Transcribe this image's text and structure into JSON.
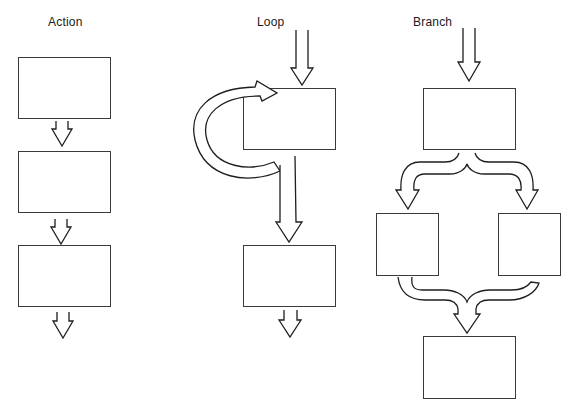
{
  "diagram": {
    "columns": [
      {
        "id": "action",
        "label": "Action",
        "boxes": 3,
        "description": "Three sequential process boxes connected by short downward arrows, with an exit arrow below the last box"
      },
      {
        "id": "loop",
        "label": "Loop",
        "boxes": 2,
        "description": "Entry arrow into a process box; a curved arrow loops from below the box back around its left side into its top; a long arrow continues down to a second box, followed by an exit arrow"
      },
      {
        "id": "branch",
        "label": "Branch",
        "boxes": 4,
        "description": "Entry arrow into a process box; a forked arrow splits into two side-by-side boxes; their outputs merge via a joining arrow into a final box"
      }
    ]
  },
  "colors": {
    "background": "#ffffff",
    "stroke": "#1e1e1e",
    "box_stroke": "#3a3a3a"
  }
}
